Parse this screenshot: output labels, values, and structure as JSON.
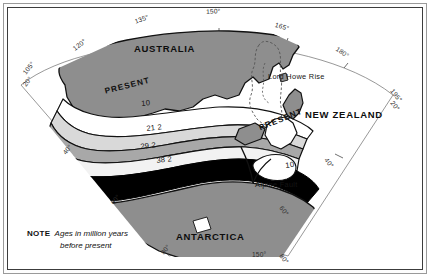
{
  "figure": {
    "kind": "tectonic-reconstruction-map",
    "note": {
      "prefix": "NOTE",
      "line1": "Ages in million years",
      "line2": "before present"
    }
  },
  "colors": {
    "land_gray": "#8e8e8e",
    "band_light": "#ffffff",
    "band_mid_light": "#d9d9d9",
    "band_mid": "#a8a8a8",
    "band_dark": "#000000",
    "outline": "#111111",
    "grid": "#6b6b6b",
    "frame": "#3c3c3c",
    "background": "#ffffff"
  },
  "continents": [
    {
      "id": "australia",
      "label": "AUSTRALIA",
      "x": 134,
      "y": 44
    },
    {
      "id": "antarctica",
      "label": "ANTARCTICA",
      "x": 176,
      "y": 232
    },
    {
      "id": "new-zealand",
      "label": "NEW ZEALAND",
      "x": 305,
      "y": 110
    }
  ],
  "present_labels": [
    {
      "id": "present-australia",
      "label": "PRESENT",
      "x": 104,
      "y": 88,
      "rotate": -14
    },
    {
      "id": "present-new-zealand",
      "label": "PRESENT",
      "x": 258,
      "y": 125,
      "rotate": -22
    }
  ],
  "features": [
    {
      "id": "lord-howe-rise",
      "label": "Lord Howe Rise",
      "x": 268,
      "y": 73
    },
    {
      "id": "alpine-fault",
      "label": "Alpine Fault",
      "x": 255,
      "y": 181
    }
  ],
  "isochrons": [
    {
      "id": "iso-10-australia",
      "label": "10",
      "x": 141,
      "y": 100,
      "rotate": -5,
      "band": "band_light"
    },
    {
      "id": "iso-21-2",
      "label": "21 2",
      "x": 146,
      "y": 125,
      "rotate": -6,
      "band": "band_mid_light"
    },
    {
      "id": "iso-29-2",
      "label": "29 2",
      "x": 140,
      "y": 143,
      "rotate": -6,
      "band": "band_mid"
    },
    {
      "id": "iso-38-2",
      "label": "38 2",
      "x": 156,
      "y": 157,
      "rotate": -6,
      "band": "band_dark"
    },
    {
      "id": "iso-10-new-zealand",
      "label": "10",
      "x": 285,
      "y": 162,
      "rotate": -8,
      "band": "band_light"
    }
  ],
  "graticule": {
    "meridian_labels": [
      {
        "id": "meridian-105",
        "label": "105°",
        "x": 22,
        "y": 72,
        "rotate": -52
      },
      {
        "id": "meridian-120",
        "label": "120°",
        "x": 72,
        "y": 47,
        "rotate": -38
      },
      {
        "id": "meridian-135",
        "label": "135°",
        "x": 134,
        "y": 19,
        "rotate": -20
      },
      {
        "id": "meridian-150",
        "label": "150°",
        "x": 206,
        "y": 9,
        "rotate": -3
      },
      {
        "id": "meridian-165",
        "label": "165°",
        "x": 276,
        "y": 22,
        "rotate": 16
      },
      {
        "id": "meridian-180",
        "label": "180°",
        "x": 338,
        "y": 46,
        "rotate": 34
      },
      {
        "id": "meridian-195",
        "label": "195°",
        "x": 394,
        "y": 88,
        "rotate": 52
      },
      {
        "id": "meridian-150-bottom",
        "label": "150°",
        "x": 252,
        "y": 252,
        "rotate": 0
      }
    ],
    "parallel_labels": [
      {
        "id": "parallel-20-left",
        "label": "20°",
        "x": 22,
        "y": 84,
        "rotate": -52
      },
      {
        "id": "parallel-20-right",
        "label": "20°",
        "x": 394,
        "y": 100,
        "rotate": 52
      },
      {
        "id": "parallel-40-left",
        "label": "40°",
        "x": 62,
        "y": 152,
        "rotate": -52
      },
      {
        "id": "parallel-60-left",
        "label": "60°",
        "x": 110,
        "y": 202,
        "rotate": -52
      },
      {
        "id": "parallel-80-left",
        "label": "80°",
        "x": 160,
        "y": 252,
        "rotate": -52
      },
      {
        "id": "parallel-40-right",
        "label": "40°",
        "x": 328,
        "y": 157,
        "rotate": 52
      },
      {
        "id": "parallel-60-right",
        "label": "60°",
        "x": 283,
        "y": 205,
        "rotate": 52
      },
      {
        "id": "parallel-80-right",
        "label": "80°",
        "x": 283,
        "y": 253,
        "rotate": 52
      }
    ]
  }
}
